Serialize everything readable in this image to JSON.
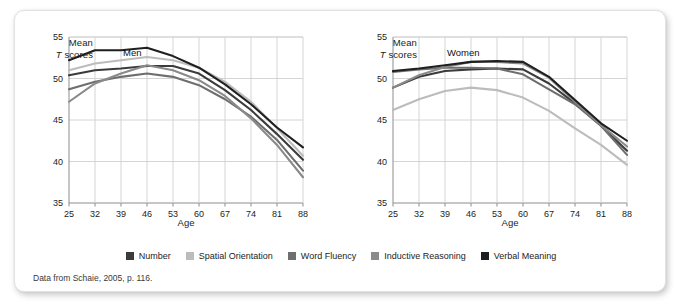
{
  "figure": {
    "source_note": "Data from Schaie, 2005, p. 116.",
    "y_axis_title_line1": "Mean",
    "y_axis_title_line2_italic": "T",
    "y_axis_title_line2_rest": " scores",
    "x_axis_label": "Age"
  },
  "legend": {
    "items": [
      {
        "label": "Number",
        "color": "#3b3b3b"
      },
      {
        "label": "Spatial Orientation",
        "color": "#bcbcbc"
      },
      {
        "label": "Word Fluency",
        "color": "#6e6e6e"
      },
      {
        "label": "Inductive Reasoning",
        "color": "#8a8a8a"
      },
      {
        "label": "Verbal Meaning",
        "color": "#1f1f1f"
      }
    ]
  },
  "chart_data": [
    {
      "type": "line",
      "title": "Men",
      "xlabel": "Age",
      "ylabel": "Mean T scores",
      "categories": [
        25,
        32,
        39,
        46,
        53,
        60,
        67,
        74,
        81,
        88
      ],
      "x": [
        25,
        32,
        39,
        46,
        53,
        60,
        67,
        74,
        81,
        88
      ],
      "xlim": [
        25,
        88
      ],
      "ylim": [
        35,
        55
      ],
      "yticks": [
        35,
        40,
        45,
        50,
        55
      ],
      "grid": true,
      "legend_position": "below-figure",
      "series": [
        {
          "name": "Number",
          "color": "#3b3b3b",
          "values": [
            50.4,
            51.0,
            51.2,
            51.5,
            51.5,
            50.6,
            48.6,
            46.2,
            43.3,
            40.2
          ]
        },
        {
          "name": "Spatial Orientation",
          "color": "#bcbcbc",
          "values": [
            51.0,
            51.8,
            52.2,
            52.6,
            52.2,
            51.3,
            49.6,
            47.2,
            44.0,
            40.7
          ]
        },
        {
          "name": "Word Fluency",
          "color": "#6e6e6e",
          "values": [
            48.7,
            49.6,
            50.2,
            50.6,
            50.2,
            49.2,
            47.5,
            45.4,
            42.6,
            38.9
          ]
        },
        {
          "name": "Inductive Reasoning",
          "color": "#8a8a8a",
          "values": [
            47.2,
            49.4,
            50.6,
            51.6,
            51.0,
            49.8,
            47.9,
            45.2,
            42.0,
            38.1
          ]
        },
        {
          "name": "Verbal Meaning",
          "color": "#1f1f1f",
          "values": [
            52.2,
            53.4,
            53.4,
            53.7,
            52.7,
            51.3,
            49.3,
            46.9,
            44.1,
            41.7
          ]
        }
      ]
    },
    {
      "type": "line",
      "title": "Women",
      "xlabel": "Age",
      "ylabel": "Mean T scores",
      "categories": [
        25,
        32,
        39,
        46,
        53,
        60,
        67,
        74,
        81,
        88
      ],
      "x": [
        25,
        32,
        39,
        46,
        53,
        60,
        67,
        74,
        81,
        88
      ],
      "xlim": [
        25,
        88
      ],
      "ylim": [
        35,
        55
      ],
      "yticks": [
        35,
        40,
        45,
        50,
        55
      ],
      "grid": true,
      "legend_position": "below-figure",
      "series": [
        {
          "name": "Number",
          "color": "#3b3b3b",
          "values": [
            48.9,
            50.2,
            50.9,
            51.1,
            51.2,
            51.1,
            49.4,
            47.0,
            44.3,
            41.3
          ]
        },
        {
          "name": "Spatial Orientation",
          "color": "#bcbcbc",
          "values": [
            46.2,
            47.5,
            48.5,
            48.9,
            48.6,
            47.7,
            46.1,
            44.0,
            42.0,
            39.6
          ]
        },
        {
          "name": "Word Fluency",
          "color": "#6e6e6e",
          "values": [
            50.8,
            51.1,
            51.3,
            51.3,
            51.2,
            50.5,
            48.7,
            46.9,
            44.3,
            40.8
          ]
        },
        {
          "name": "Inductive Reasoning",
          "color": "#8a8a8a",
          "values": [
            48.9,
            50.4,
            51.4,
            52.0,
            52.0,
            51.8,
            50.1,
            47.2,
            44.4,
            41.8
          ]
        },
        {
          "name": "Verbal Meaning",
          "color": "#1f1f1f",
          "values": [
            50.9,
            51.2,
            51.6,
            52.0,
            52.1,
            52.0,
            50.2,
            47.4,
            44.6,
            42.5
          ]
        }
      ]
    }
  ]
}
